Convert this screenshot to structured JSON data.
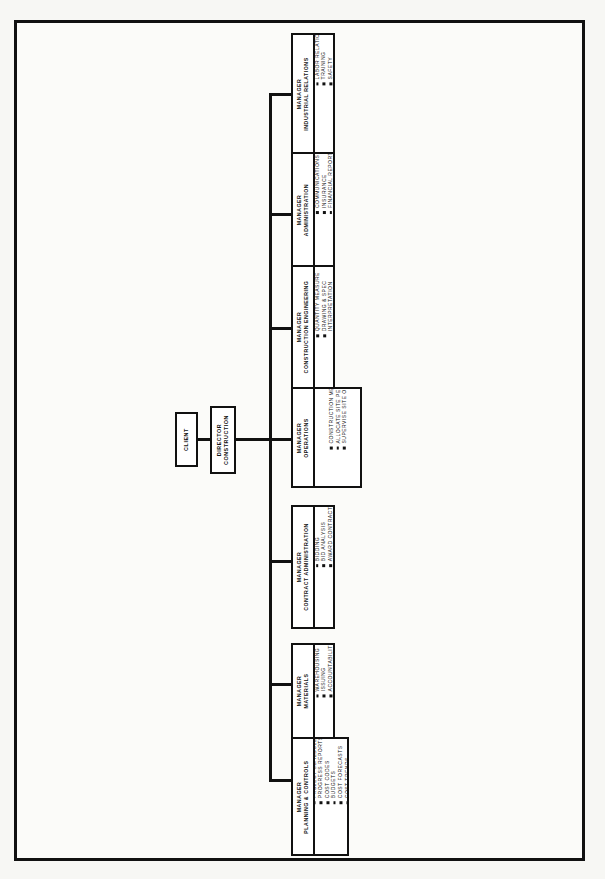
{
  "document": {
    "title": "Construction Project Organization Chart",
    "orientation": "rotated-90"
  },
  "chart_data": {
    "type": "diagram",
    "diagram_type": "organization-chart",
    "root": "CLIENT",
    "edges": [
      [
        "CLIENT",
        "DIRECTOR CONSTRUCTION"
      ],
      [
        "DIRECTOR CONSTRUCTION",
        "MANAGER PLANNING & CONTROLS"
      ],
      [
        "DIRECTOR CONSTRUCTION",
        "MANAGER MATERIALS"
      ],
      [
        "DIRECTOR CONSTRUCTION",
        "MANAGER CONTRACT ADMINISTRATION"
      ],
      [
        "DIRECTOR CONSTRUCTION",
        "MANAGER OPERATIONS"
      ],
      [
        "DIRECTOR CONSTRUCTION",
        "MANAGER CONSTRUCTION ENGINEERING"
      ],
      [
        "DIRECTOR CONSTRUCTION",
        "MANAGER ADMINISTRATION"
      ],
      [
        "DIRECTOR CONSTRUCTION",
        "MANAGER INDUSTRIAL RELATIONS"
      ]
    ]
  },
  "client": {
    "title_line1": "CLIENT"
  },
  "director": {
    "title_line1": "DIRECTOR",
    "title_line2": "CONSTRUCTION"
  },
  "nodes": [
    {
      "id": "planning-controls",
      "title_line1": "MANAGER",
      "title_line2": "PLANNING & CONTROLS",
      "items": [
        "MASTER SCHEDULES",
        "PROJECT SCHEDULES",
        "PROGRESS REPORTS",
        "COST CODES",
        "BUDGETS",
        "COST FORECASTS",
        "COST TRENDS",
        "COST REPORTS"
      ]
    },
    {
      "id": "materials",
      "title_line1": "MANAGER",
      "title_line2": "MATERIALS",
      "items": [
        "RECEIVING",
        "WAREHOUSING",
        "ISSUING",
        "ACCOUNTABILITY",
        "MATERIAL REPORTS"
      ]
    },
    {
      "id": "contract-administration",
      "title_line1": "MANAGER",
      "title_line2": "CONTRACT ADMINISTRATION",
      "items": [
        "PACKAGE PREPARATION",
        "BIDDING",
        "BID ANALYSIS",
        "AWARD CONTRACTS",
        "ADMINISTER CONTRACTS"
      ]
    },
    {
      "id": "operations",
      "title_line1": "MANAGER",
      "title_line2": "OPERATIONS",
      "items": [
        "CONSTRUCTION METHODS",
        "ALLOCATE SITE PERSONNEL",
        "SUPERVISE SITE OPERATIONS"
      ]
    },
    {
      "id": "construction-engineering",
      "title_line1": "MANAGER",
      "title_line2": "CONSTRUCTION ENGINEERING",
      "items": [
        "SURVEY CONTROL",
        "DRAWING & SPEC CONTROL",
        "QUANTITY MEASURE",
        "DRAWING & SPEC",
        "INTERPRETATION",
        "QUALITY CONTROL",
        "START UP & TESTING"
      ],
      "continuation_indexes": [
        4
      ]
    },
    {
      "id": "administration",
      "title_line1": "MANAGER",
      "title_line2": "ADMINISTRATION",
      "items": [
        "ACCOUNTING",
        "PAYROLL",
        "COMMUNICATIONS",
        "INSURANCE",
        "FINANCIAL REPORTS",
        "OFFICE SERVICES",
        "PROCUREMENT"
      ]
    },
    {
      "id": "industrial-relations",
      "title_line1": "MANAGER",
      "title_line2": "INDUSTRIAL RELATIONS",
      "items": [
        "PERSONNEL",
        "LABOR RELATIONS",
        "TRAINING",
        "SAFETY",
        "SECURITY"
      ]
    }
  ],
  "colors": {
    "ink": "#111111",
    "paper": "#ffffff",
    "page": "#f7f7f4"
  }
}
